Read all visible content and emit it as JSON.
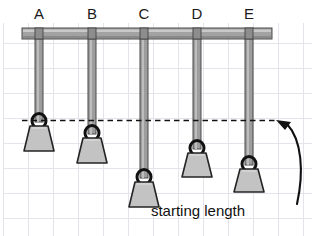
{
  "diagram": {
    "caption": "starting length",
    "background_color": "#ffffff",
    "grid": {
      "visible": true,
      "color": "#e3e3e8",
      "spacing_px": 25,
      "x_start": 3,
      "y_start": 23
    },
    "support_bar": {
      "name": "support-bar",
      "fill": "#9a9a9a",
      "stroke": "#4d4d4d",
      "x": 22,
      "y": 28,
      "width": 250,
      "height": 10
    },
    "reference_line": {
      "name": "starting-length-dashed-line",
      "label": "starting length",
      "y": 120,
      "x_start": 22,
      "x_end": 276,
      "color": "#111111",
      "style": "dashed"
    },
    "arrow": {
      "name": "curved-arrow",
      "color": "#111111",
      "points_to": "starting length line"
    },
    "string_color": "#8a8a8a",
    "string_stroke": "#4a4a4a",
    "weight_fill": "#c0c0c0",
    "weight_stroke": "#2b2b2b",
    "ring_stroke": "#111111",
    "pendulums": [
      {
        "label": "A",
        "label_x": 39,
        "x": 39,
        "string_top": 33,
        "ring_center_y": 121,
        "string_length_px": 88,
        "bob_top_y": 126,
        "bob_bottom_y": 151,
        "bob_top_width": 18,
        "bob_bottom_width": 30,
        "position_vs_line": "at"
      },
      {
        "label": "B",
        "label_x": 92,
        "x": 92,
        "string_top": 33,
        "ring_center_y": 133,
        "string_length_px": 100,
        "bob_top_y": 138,
        "bob_bottom_y": 163,
        "bob_top_width": 18,
        "bob_bottom_width": 30,
        "position_vs_line": "below"
      },
      {
        "label": "C",
        "label_x": 144,
        "x": 144,
        "string_top": 33,
        "ring_center_y": 177,
        "string_length_px": 144,
        "bob_top_y": 182,
        "bob_bottom_y": 207,
        "bob_top_width": 18,
        "bob_bottom_width": 30,
        "position_vs_line": "below"
      },
      {
        "label": "D",
        "label_x": 197,
        "x": 197,
        "string_top": 33,
        "ring_center_y": 148,
        "string_length_px": 115,
        "bob_top_y": 153,
        "bob_bottom_y": 177,
        "bob_top_width": 18,
        "bob_bottom_width": 30,
        "position_vs_line": "below"
      },
      {
        "label": "E",
        "label_x": 249,
        "x": 249,
        "string_top": 33,
        "ring_center_y": 164,
        "string_length_px": 131,
        "bob_top_y": 169,
        "bob_bottom_y": 192,
        "bob_top_width": 18,
        "bob_bottom_width": 30,
        "position_vs_line": "below"
      }
    ],
    "labels_row": {
      "name": "pendulum-letter-labels",
      "y": 18,
      "items": [
        "A",
        "B",
        "C",
        "D",
        "E"
      ]
    }
  }
}
